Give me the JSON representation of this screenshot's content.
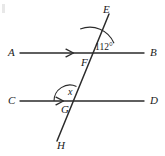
{
  "figure": {
    "type": "geometry-diagram",
    "stroke_color": "#2b2b2b",
    "text_color": "#1a1a1a",
    "background": "#ffffff",
    "width": 165,
    "height": 156
  },
  "lines": [
    {
      "name": "line-ab",
      "start_label": "A",
      "end_label": "B",
      "x1": 20,
      "y1": 53,
      "x2": 144,
      "y2": 53,
      "parallel_mark": "single-arrow",
      "mark_x": 72,
      "mark_y": 53
    },
    {
      "name": "line-cd",
      "start_label": "C",
      "end_label": "D",
      "x1": 20,
      "y1": 101,
      "x2": 144,
      "y2": 101,
      "parallel_mark": "single-arrow",
      "mark_x": 62,
      "mark_y": 101
    },
    {
      "name": "transversal-eh",
      "start_label": "E",
      "end_label": "H",
      "x1": 109,
      "y1": 14,
      "x2": 57,
      "y2": 141
    }
  ],
  "points": [
    {
      "name": "point-a",
      "label": "A",
      "x": 8,
      "y": 47
    },
    {
      "name": "point-b",
      "label": "B",
      "x": 150,
      "y": 47
    },
    {
      "name": "point-c",
      "label": "C",
      "x": 8,
      "y": 95
    },
    {
      "name": "point-d",
      "label": "D",
      "x": 150,
      "y": 95
    },
    {
      "name": "point-e",
      "label": "E",
      "x": 103,
      "y": 4
    },
    {
      "name": "point-f",
      "label": "F",
      "x": 81,
      "y": 57
    },
    {
      "name": "point-g",
      "label": "G",
      "x": 61,
      "y": 104
    },
    {
      "name": "point-h",
      "label": "H",
      "x": 57,
      "y": 140
    }
  ],
  "intersections": [
    {
      "name": "intersection-f",
      "label": "F",
      "x": 90,
      "y": 53
    },
    {
      "name": "intersection-g",
      "label": "G",
      "x": 70,
      "y": 101
    }
  ],
  "angles": [
    {
      "name": "angle-112",
      "label": "112°",
      "value": 112,
      "vertex": "F",
      "vertex_x": 90,
      "vertex_y": 53,
      "radius": 24,
      "label_x": 95,
      "label_y": 43,
      "between": [
        "ray-FE",
        "ray-FB"
      ]
    },
    {
      "name": "angle-x",
      "label": "x",
      "value": null,
      "vertex": "G",
      "vertex_x": 70,
      "vertex_y": 101,
      "radius": 15,
      "label_x": 68,
      "label_y": 87,
      "between": [
        "ray-GC",
        "ray-GE"
      ]
    }
  ]
}
